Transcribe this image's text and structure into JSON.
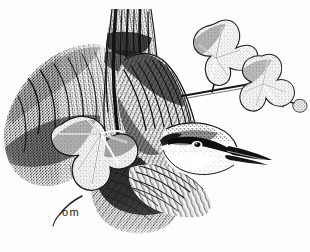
{
  "artwork": {
    "title": "Eurasian Nuthatch on Tree Trunk with Ivy",
    "subject": "nuthatch bird perched head-downward on a tree trunk",
    "medium": "pen and ink stipple and hatch drawing",
    "signature": "om",
    "palette": {
      "background": "#fefefe",
      "ink": "#151515",
      "mid_tone": "#5a5a5a",
      "light_tone": "#a8a8a8",
      "paper_shadow": "#d8d8d8"
    },
    "canvas": {
      "width": 310,
      "height": 252
    },
    "elements": [
      {
        "name": "tree-trunk",
        "label": "Tree trunk, vertical, upper center"
      },
      {
        "name": "bark-mass-left",
        "label": "Hatched bark mass, left side"
      },
      {
        "name": "bark-mass-lower",
        "label": "Dark stippled bark, lower center"
      },
      {
        "name": "nuthatch-body",
        "label": "Nuthatch body with wing feathers"
      },
      {
        "name": "nuthatch-head",
        "label": "Nuthatch head with black eye stripe"
      },
      {
        "name": "nuthatch-beak",
        "label": "Long pointed beak, lower right"
      },
      {
        "name": "nuthatch-breast",
        "label": "Pale breast and flank feathering"
      },
      {
        "name": "ivy-leaf-upper-right",
        "label": "Ivy leaf, upper right"
      },
      {
        "name": "ivy-leaf-far-right",
        "label": "Ivy leaf, right middle"
      },
      {
        "name": "ivy-leaf-lower-left",
        "label": "Ivy leaf, lower left"
      },
      {
        "name": "ivy-stem",
        "label": "Ivy stem connecting leaves"
      },
      {
        "name": "artist-signature",
        "label": "om"
      }
    ]
  }
}
